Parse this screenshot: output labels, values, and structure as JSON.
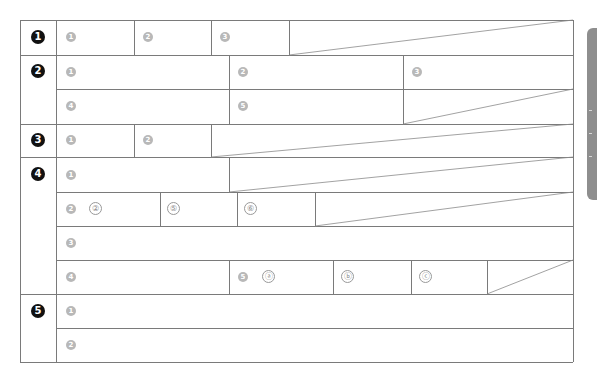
{
  "form": {
    "sections": [
      {
        "number": "1",
        "fields": [
          "1",
          "2",
          "3"
        ]
      },
      {
        "number": "2",
        "fields": [
          "1",
          "2",
          "3",
          "4",
          "5"
        ]
      },
      {
        "number": "3",
        "fields": [
          "1",
          "2"
        ]
      },
      {
        "number": "4",
        "fields": [
          "1",
          "2",
          "3",
          "4",
          "5"
        ],
        "sub_items": {
          "row2": [
            "②",
            "⑤",
            "⑥"
          ],
          "row4": [
            "ⓐ",
            "ⓑ",
            "ⓒ"
          ]
        }
      },
      {
        "number": "5",
        "fields": [
          "1",
          "2"
        ]
      }
    ]
  },
  "side_tab": {
    "color": "#8e8e8e"
  },
  "colors": {
    "line": "#7a7a7a",
    "section_badge": "#111111",
    "field_badge": "#b8b8b8"
  }
}
